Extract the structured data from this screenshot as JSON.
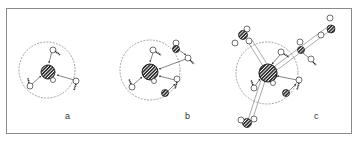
{
  "figure": {
    "panels": [
      {
        "id": "a",
        "label": "a",
        "center": [
          47,
          70
        ],
        "shell_radius": 28,
        "core_radius": 7
      },
      {
        "id": "b",
        "label": "b",
        "center": [
          150,
          70
        ],
        "shell_radius": 30,
        "core_radius": 8
      },
      {
        "id": "c",
        "label": "c",
        "center": [
          267,
          73
        ],
        "shell_radius": 31,
        "core_radius": 9
      }
    ],
    "colors": {
      "frame": "#8a8a8a",
      "line": "#333333",
      "hatch": "#222222",
      "background": "#ffffff"
    }
  }
}
